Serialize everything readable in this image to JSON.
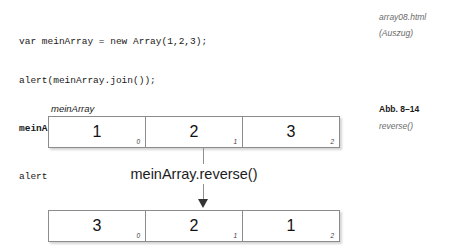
{
  "code": {
    "lines": [
      {
        "text": "var meinArray = new Array(1,2,3);",
        "bold": false
      },
      {
        "text": "alert(meinArray.join());",
        "bold": false
      },
      {
        "text": "meinArray.reverse();",
        "bold": true
      },
      {
        "text": "alert(meinArray.join());",
        "bold": false
      }
    ]
  },
  "margin": {
    "file": "array08.html",
    "excerpt": "(Auszug)",
    "figure_number": "Abb. 8–14",
    "figure_caption": "reverse()"
  },
  "diagram": {
    "variable_label": "meinArray",
    "operation_label": "meinArray.reverse()",
    "before": {
      "values": [
        "1",
        "2",
        "3"
      ],
      "indices": [
        "0",
        "1",
        "2"
      ]
    },
    "after": {
      "values": [
        "3",
        "2",
        "1"
      ],
      "indices": [
        "0",
        "1",
        "2"
      ]
    }
  }
}
